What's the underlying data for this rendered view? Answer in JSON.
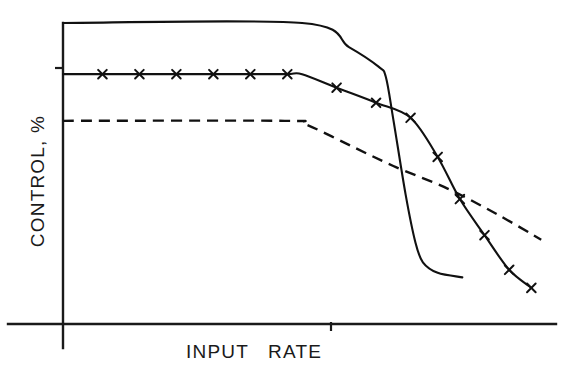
{
  "chart_data": {
    "type": "line",
    "title": "",
    "subtitle": "",
    "xlabel": "INPUT   RATE",
    "ylabel": "CONTROL, %",
    "xlim": [
      0,
      100
    ],
    "ylim": [
      0,
      100
    ],
    "grid": false,
    "legend": null,
    "axis_ticks": {
      "x_tick_labels": [],
      "y_tick_labels": [],
      "x_unlabeled_ticks": [
        1
      ],
      "y_unlabeled_ticks": [
        1
      ]
    },
    "series": [
      {
        "name": "upper-solid-curve",
        "style": "solid",
        "marker": "none",
        "color": "#111111",
        "points": [
          [
            0,
            100
          ],
          [
            48.5,
            100
          ],
          [
            58.0,
            92.0
          ],
          [
            64.0,
            85.5
          ],
          [
            65.5,
            82.0
          ],
          [
            67.0,
            68.0
          ],
          [
            69.5,
            43.0
          ],
          [
            71.5,
            27.0
          ],
          [
            73.0,
            20.5
          ],
          [
            76.0,
            17.0
          ],
          [
            81.0,
            15.5
          ]
        ]
      },
      {
        "name": "middle-cross-marked-curve",
        "style": "solid",
        "marker": "x",
        "color": "#111111",
        "points": [
          [
            0,
            83.0
          ],
          [
            8.0,
            83.0
          ],
          [
            15.5,
            83.0
          ],
          [
            23.0,
            83.0
          ],
          [
            30.5,
            83.0
          ],
          [
            38.0,
            83.0
          ],
          [
            45.5,
            83.0
          ],
          [
            48.5,
            83.0
          ],
          [
            55.5,
            78.5
          ],
          [
            63.5,
            73.5
          ],
          [
            70.5,
            68.5
          ],
          [
            76.0,
            55.5
          ],
          [
            80.5,
            41.5
          ],
          [
            85.5,
            29.5
          ],
          [
            90.5,
            18.0
          ],
          [
            95.0,
            12.0
          ]
        ],
        "marker_points": [
          [
            8.0,
            83.0
          ],
          [
            15.5,
            83.0
          ],
          [
            23.0,
            83.0
          ],
          [
            30.5,
            83.0
          ],
          [
            38.0,
            83.0
          ],
          [
            45.5,
            83.0
          ],
          [
            55.5,
            78.5
          ],
          [
            63.5,
            73.5
          ],
          [
            70.5,
            68.5
          ],
          [
            76.0,
            55.5
          ],
          [
            80.5,
            41.5
          ],
          [
            85.5,
            29.5
          ],
          [
            90.5,
            18.0
          ],
          [
            95.0,
            12.0
          ]
        ]
      },
      {
        "name": "lower-dashed-curve",
        "style": "dashed",
        "marker": "none",
        "color": "#111111",
        "points": [
          [
            0,
            67.5
          ],
          [
            45.0,
            67.5
          ],
          [
            49.0,
            66.5
          ],
          [
            58.0,
            59.5
          ],
          [
            67.0,
            52.5
          ],
          [
            78.0,
            45.0
          ],
          [
            88.0,
            36.5
          ],
          [
            97.0,
            28.0
          ]
        ]
      }
    ]
  },
  "geometry": {
    "origin": {
      "x": 63,
      "y": 324
    },
    "x_axis_end": {
      "x": 556,
      "y": 324
    },
    "y_axis_top": {
      "x": 63,
      "y": 23
    },
    "y_tick": {
      "x0": 56,
      "x1": 63,
      "y": 68
    },
    "x_tick": {
      "x": 331,
      "y0": 324,
      "y1": 331
    }
  },
  "labels": {
    "y_axis": "CONTROL, %",
    "x_axis": "INPUT   RATE"
  },
  "colors": {
    "ink": "#111111",
    "axis": "#1a1a1a",
    "background": "#ffffff"
  }
}
